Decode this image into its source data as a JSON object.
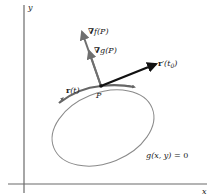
{
  "diagram": {
    "type": "gradient-constraint-illustration",
    "axes": {
      "x_label": "x",
      "y_label": "y"
    },
    "point": {
      "label": "P"
    },
    "vectors": [
      {
        "id": "grad-f",
        "label_prefix": "∇",
        "label_func": "f",
        "label_arg": "(P)"
      },
      {
        "id": "grad-g",
        "label_prefix": "∇",
        "label_func": "g",
        "label_arg": "(P)"
      },
      {
        "id": "tangent",
        "label_prefix": "r",
        "label_prime": "′",
        "label_arg": "(t",
        "label_sub": "0",
        "label_close": ")"
      }
    ],
    "curve": {
      "param_label_bold": "r",
      "param_label_arg": "(t)",
      "constraint_func": "g",
      "constraint_args": "(x, y)",
      "constraint_rhs": " = 0"
    },
    "colors": {
      "axis": "#6b6b6b",
      "curve": "#8a8a8a",
      "highlight_arc": "#666666",
      "gradient_vector": "#6f6f6f",
      "tangent_vector": "#111111",
      "text": "#222222"
    }
  }
}
